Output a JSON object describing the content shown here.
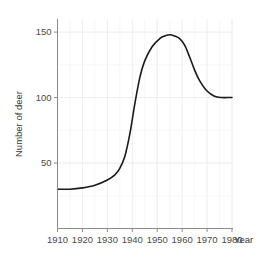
{
  "chart_data": {
    "type": "line",
    "title": "",
    "xlabel": "Year",
    "ylabel": "Number of deer",
    "xlim": [
      1910,
      1980
    ],
    "ylim": [
      0,
      160
    ],
    "grid": true,
    "legend": "none",
    "x_ticks": [
      1910,
      1920,
      1930,
      1940,
      1950,
      1960,
      1970,
      1980
    ],
    "x_tick_labels": [
      "1910",
      "1920",
      "1930",
      "1940",
      "1950",
      "1960",
      "1970",
      "1980"
    ],
    "y_ticks": [
      50,
      100,
      150
    ],
    "y_tick_labels": [
      "50",
      "100",
      "150"
    ],
    "x_minor_step": 5,
    "y_minor_step": 25,
    "series": [
      {
        "name": "Number of deer",
        "color": "#1a1a1a",
        "x": [
          1910,
          1915,
          1920,
          1925,
          1930,
          1933,
          1935,
          1937,
          1939,
          1941,
          1943,
          1945,
          1948,
          1951,
          1953,
          1955,
          1957,
          1959,
          1961,
          1963,
          1965,
          1967,
          1970,
          1973,
          1976,
          1978,
          1980
        ],
        "values": [
          30,
          30,
          31,
          33,
          37,
          41,
          46,
          55,
          72,
          95,
          115,
          128,
          139,
          145,
          147,
          148,
          147,
          145,
          140,
          131,
          121,
          113,
          105,
          101,
          100,
          100,
          100
        ]
      }
    ],
    "annotations": []
  },
  "figure": {
    "background_color": "#ffffff",
    "grid_major_color": "#ececec",
    "grid_minor_color": "#f4f4f4",
    "axis_color": "#8a8a8a",
    "text_color": "#3a3a3a"
  }
}
